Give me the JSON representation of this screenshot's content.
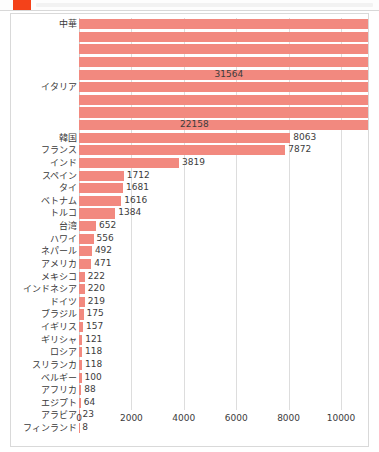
{
  "window": {
    "app_icon": "app-square-icon"
  },
  "chart_data": {
    "type": "bar",
    "orientation": "horizontal",
    "title": "",
    "xlabel": "",
    "ylabel": "",
    "xlim": [
      0,
      10000
    ],
    "xticks": [
      0,
      2000,
      4000,
      6000,
      8000,
      10000
    ],
    "xtick_labels": [
      "0",
      "2000",
      "4000",
      "6000",
      "8000",
      "10000"
    ],
    "grid": true,
    "bar_color": "#f2897f",
    "clipped_note": "bars exceeding 10000 are clipped at the plot right edge",
    "categories": [
      "中華",
      "",
      "",
      "",
      "",
      "イタリア",
      "",
      "",
      "",
      "韓国",
      "フランス",
      "インド",
      "スペイン",
      "タイ",
      "ベトナム",
      "トルコ",
      "台湾",
      "ハワイ",
      "ネパール",
      "アメリカ",
      "メキシコ",
      "インドネシア",
      "ドイツ",
      "ブラジル",
      "イギリス",
      "ギリシャ",
      "ロシア",
      "スリランカ",
      "ベルギー",
      "アフリカ",
      "エジプト",
      "アラビア",
      "フィンランド"
    ],
    "values": [
      14000,
      13000,
      12500,
      12000,
      31564,
      14000,
      13500,
      13000,
      22158,
      8063,
      7872,
      3819,
      1712,
      1681,
      1616,
      1384,
      652,
      556,
      492,
      471,
      222,
      220,
      219,
      175,
      157,
      121,
      118,
      118,
      100,
      88,
      64,
      23,
      8
    ],
    "value_labels": [
      "",
      "",
      "",
      "",
      "31564",
      "",
      "",
      "",
      "22158",
      "8063",
      "7872",
      "3819",
      "1712",
      "1681",
      "1616",
      "1384",
      "652",
      "556",
      "492",
      "471",
      "222",
      "220",
      "219",
      "175",
      "157",
      "121",
      "118",
      "118",
      "100",
      "88",
      "64",
      "23",
      "8"
    ]
  }
}
